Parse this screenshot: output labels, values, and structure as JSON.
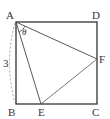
{
  "diagram": {
    "type": "geometry",
    "shape": "square ABCD with inscribed triangle AEF",
    "vertices": {
      "A": {
        "label": "A",
        "x": 16,
        "y": 22
      },
      "B": {
        "label": "B",
        "x": 16,
        "y": 104
      },
      "C": {
        "label": "C",
        "x": 97,
        "y": 104
      },
      "D": {
        "label": "D",
        "x": 97,
        "y": 22
      },
      "E": {
        "label": "E",
        "x": 41,
        "y": 104
      },
      "F": {
        "label": "F",
        "x": 97,
        "y": 59
      }
    },
    "angle_label": "θ",
    "side_label": "3",
    "colors": {
      "stroke": "#333333",
      "thin": "#555555"
    }
  }
}
